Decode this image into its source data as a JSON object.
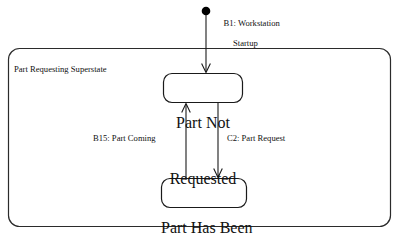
{
  "diagram": {
    "type": "uml-state-machine",
    "background_color": "#ffffff",
    "line_color": "#1a1a1a",
    "superstate": {
      "label": "Part Requesting Superstate"
    },
    "initial_state": {
      "transition_label_line1": "B1: Workstation",
      "transition_label_line2": "Startup"
    },
    "states": [
      {
        "id": "part-not-requested",
        "line1": "Part Not",
        "line2": "Requested"
      },
      {
        "id": "part-has-been-requested",
        "line1": "Part Has Been",
        "line2": "Requested"
      }
    ],
    "transitions": [
      {
        "id": "b15",
        "label": "B15: Part Coming",
        "from": "part-has-been-requested",
        "to": "part-not-requested",
        "direction": "up"
      },
      {
        "id": "c2",
        "label": "C2: Part Request",
        "from": "part-not-requested",
        "to": "part-has-been-requested",
        "direction": "down"
      }
    ]
  }
}
